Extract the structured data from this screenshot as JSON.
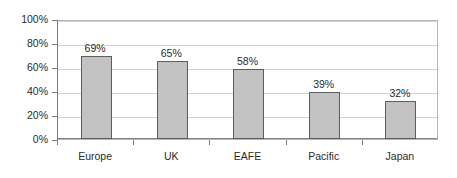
{
  "chart_data": {
    "type": "bar",
    "title": "",
    "subtitle": "",
    "xlabel": "",
    "ylabel": "",
    "categories": [
      "Europe",
      "UK",
      "EAFE",
      "Pacific",
      "Japan"
    ],
    "values": [
      69,
      65,
      58,
      39,
      32
    ],
    "data_labels": [
      "69%",
      "65%",
      "58%",
      "39%",
      "32%"
    ],
    "ylim": [
      0,
      100
    ],
    "ytick_values": [
      0,
      20,
      40,
      60,
      80,
      100
    ],
    "ytick_labels": [
      "0%",
      "20%",
      "40%",
      "60%",
      "80%",
      "100%"
    ],
    "grid": true,
    "grid_axis": "y",
    "legend": false,
    "legend_position": "none",
    "series": [
      {
        "name": "",
        "values": [
          69,
          65,
          58,
          39,
          32
        ]
      }
    ],
    "colors": {
      "bar_fill": "#c2c2c2",
      "bar_border": "#5d5d5d",
      "gridline": "#d2d2d2",
      "axis": "#7d7d7d",
      "plot_border": "#b7b7b7",
      "text": "#2b2b2b",
      "background": "#ffffff"
    }
  }
}
